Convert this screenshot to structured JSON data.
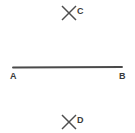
{
  "figure": {
    "type": "geometry-diagram",
    "background_color": "#ffffff",
    "stroke_color": "#4a4a4a",
    "label_color": "#3b3b3b",
    "width": 135,
    "height": 133,
    "points": [
      {
        "id": "A",
        "label": "A",
        "role": "segment-endpoint",
        "marker": "line-end",
        "x": 13,
        "y": 67,
        "label_x": 10,
        "label_y": 72
      },
      {
        "id": "B",
        "label": "B",
        "role": "segment-endpoint",
        "marker": "line-end",
        "x": 122,
        "y": 67,
        "label_x": 119,
        "label_y": 72
      },
      {
        "id": "C",
        "label": "C",
        "role": "free-point",
        "marker": "x-cross",
        "x": 69,
        "y": 13,
        "label_x": 77,
        "label_y": 7
      },
      {
        "id": "D",
        "label": "D",
        "role": "free-point",
        "marker": "x-cross",
        "x": 69,
        "y": 122,
        "label_x": 77,
        "label_y": 116
      }
    ],
    "segments": [
      {
        "id": "AB",
        "from": "A",
        "to": "B",
        "x1": 13,
        "y1": 67.5,
        "x2": 122,
        "y2": 67.0
      }
    ],
    "crosses": [
      {
        "id": "cross-C",
        "cx": 69,
        "cy": 13,
        "size": 7
      },
      {
        "id": "cross-D",
        "cx": 69,
        "cy": 122,
        "size": 7
      }
    ]
  }
}
